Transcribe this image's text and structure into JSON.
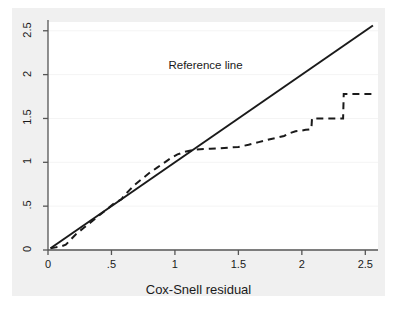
{
  "chart_data": {
    "type": "line",
    "title": "",
    "subtitle": "",
    "xlabel": "Cox-Snell residual",
    "ylabel": "",
    "xlim": [
      0,
      2.6
    ],
    "ylim": [
      0,
      2.6
    ],
    "grid": true,
    "grid_color": "#f4f4f4",
    "legend_position": "none",
    "background_color": "#f0f0f0",
    "panel_color": "#ffffff",
    "axis_color": "#555555",
    "xticks": [
      0,
      0.5,
      1,
      1.5,
      2,
      2.5
    ],
    "xticklabels": [
      "0",
      ".5",
      "1",
      "1.5",
      "2",
      "2.5"
    ],
    "yticks": [
      0,
      0.5,
      1,
      1.5,
      2,
      2.5
    ],
    "yticklabels": [
      "0",
      ".5",
      "1",
      "1.5",
      "2",
      "2.5"
    ],
    "annotations": [
      {
        "text": "Reference line",
        "x": 1.28,
        "y": 2.1,
        "name": "reference-line-annotation"
      }
    ],
    "series": [
      {
        "name": "Reference line",
        "style": "solid",
        "color": "#1a1a1a",
        "width": 2.0,
        "x": [
          0.02,
          2.56
        ],
        "values": [
          0.02,
          2.56
        ]
      },
      {
        "name": "Nelson-Aalen cumulative hazard",
        "style": "dashed",
        "color": "#1a1a1a",
        "width": 2.0,
        "dash_pattern": "7,5",
        "x": [
          0.02,
          0.06,
          0.1,
          0.14,
          0.18,
          0.22,
          0.28,
          0.34,
          0.4,
          0.46,
          0.52,
          0.58,
          0.6,
          0.64,
          0.68,
          0.74,
          0.8,
          0.86,
          0.92,
          0.97,
          1.02,
          1.08,
          1.14,
          1.2,
          1.28,
          1.36,
          1.44,
          1.5,
          1.58,
          1.66,
          1.74,
          1.8,
          1.86,
          1.9,
          1.95,
          1.99,
          2.03,
          2.06,
          2.075,
          2.08,
          2.14,
          2.22,
          2.3,
          2.325,
          2.33,
          2.4,
          2.48,
          2.56
        ],
        "values": [
          0.02,
          0.03,
          0.04,
          0.06,
          0.12,
          0.18,
          0.25,
          0.32,
          0.39,
          0.46,
          0.53,
          0.58,
          0.62,
          0.68,
          0.74,
          0.81,
          0.88,
          0.94,
          1.0,
          1.05,
          1.09,
          1.12,
          1.14,
          1.15,
          1.155,
          1.16,
          1.17,
          1.175,
          1.2,
          1.23,
          1.26,
          1.28,
          1.3,
          1.33,
          1.355,
          1.36,
          1.37,
          1.375,
          1.38,
          1.5,
          1.5,
          1.5,
          1.5,
          1.5,
          1.78,
          1.78,
          1.78,
          1.78
        ]
      }
    ]
  },
  "axis": {
    "x_title": "Cox-Snell residual",
    "x_tick_labels": [
      "0",
      ".5",
      "1",
      "1.5",
      "2",
      "2.5"
    ],
    "y_tick_labels": [
      "0",
      ".5",
      "1",
      "1.5",
      "2",
      "2.5"
    ]
  },
  "annotation": {
    "reference_line": "Reference line"
  }
}
